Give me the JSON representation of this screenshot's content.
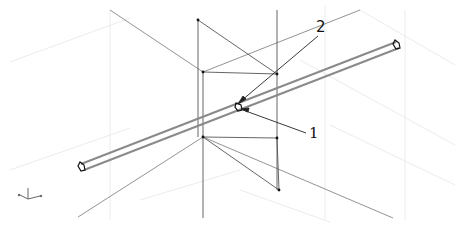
{
  "diagram": {
    "type": "isometric-wireframe",
    "colors": {
      "background": "#ffffff",
      "grid": "#ececec",
      "frame_line": "#555555",
      "guide_line": "#777777",
      "tube": "#8a8a8a",
      "leader": "#222222",
      "node": "#111111"
    },
    "callouts": [
      {
        "id": "1",
        "text": "1",
        "target": "tube-lower-edge-at-intersection"
      },
      {
        "id": "2",
        "text": "2",
        "target": "tube-upper-edge-at-intersection"
      }
    ],
    "axis_icon": {
      "name": "ucs-axis-indicator"
    }
  }
}
